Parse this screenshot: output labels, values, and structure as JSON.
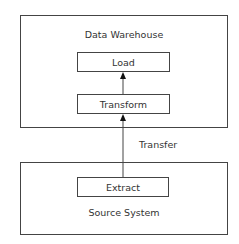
{
  "diagram": {
    "warehouse": {
      "title": "Data Warehouse",
      "load": "Load",
      "transform": "Transform"
    },
    "transfer_label": "Transfer",
    "source": {
      "title": "Source System",
      "extract": "Extract"
    }
  }
}
